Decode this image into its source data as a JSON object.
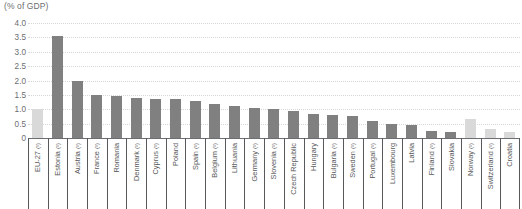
{
  "unit_label": "(% of GDP)",
  "colors": {
    "bar_eu_member": "#808080",
    "bar_aggregate_or_non_eu": "#d9d9d9",
    "axis": "#58595b",
    "gridline": "#d7d7d7",
    "text": "#6d6e71"
  },
  "chart_data": {
    "type": "bar",
    "title": "",
    "subtitle": "",
    "xlabel": "",
    "ylabel": "(% of GDP)",
    "ylim": [
      0,
      4.0
    ],
    "ytick_labels": [
      "0",
      "0.5",
      "1.0",
      "1.5",
      "2.0",
      "2.5",
      "3.0",
      "3.5",
      "4.0"
    ],
    "ytick_values": [
      0,
      0.5,
      1.0,
      1.5,
      2.0,
      2.5,
      3.0,
      3.5,
      4.0
    ],
    "grid": true,
    "legend": "none",
    "categories": [
      "EU-27 (¹)",
      "Estonia (¹)",
      "Austria (¹)",
      "France (¹)",
      "Romania",
      "Denmark (¹)",
      "Cyprus (¹)",
      "Poland",
      "Spain (¹)",
      "Belgium (¹)",
      "Lithuania",
      "Germany (¹)",
      "Slovenia (¹)",
      "Czech Republic",
      "Hungary",
      "Bulgaria (¹)",
      "Sweden (¹)",
      "Portugal (¹)",
      "Luxembourg",
      "Latvia",
      "Finland (¹)",
      "Slovakia",
      "Norway (¹)",
      "Switzerland (¹)",
      "Croatia"
    ],
    "values": [
      1.0,
      3.55,
      2.0,
      1.5,
      1.45,
      1.4,
      1.35,
      1.35,
      1.3,
      1.2,
      1.1,
      1.05,
      1.0,
      0.95,
      0.85,
      0.8,
      0.75,
      0.6,
      0.5,
      0.45,
      0.25,
      0.2,
      0.65,
      0.3,
      0.2
    ],
    "series_styles": [
      "light",
      "dark",
      "dark",
      "dark",
      "dark",
      "dark",
      "dark",
      "dark",
      "dark",
      "dark",
      "dark",
      "dark",
      "dark",
      "dark",
      "dark",
      "dark",
      "dark",
      "dark",
      "dark",
      "dark",
      "dark",
      "dark",
      "light",
      "light",
      "light"
    ]
  }
}
